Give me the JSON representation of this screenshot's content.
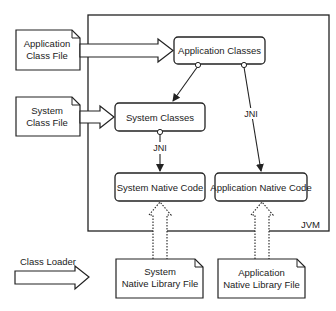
{
  "diagram": {
    "container": {
      "label": "JVM"
    },
    "files": {
      "application_class_file": [
        "Application",
        "Class File"
      ],
      "system_class_file": [
        "System",
        "Class File"
      ],
      "system_native_library_file": [
        "System",
        "Native Library File"
      ],
      "application_native_library_file": [
        "Application",
        "Native Library File"
      ]
    },
    "nodes": {
      "application_classes": "Application Classes",
      "system_classes": "System Classes",
      "system_native_code": "System Native Code",
      "application_native_code": "Application Native Code"
    },
    "edges": {
      "jni_system": "JNI",
      "jni_application": "JNI"
    },
    "legend": {
      "class_loader": "Class Loader"
    }
  }
}
